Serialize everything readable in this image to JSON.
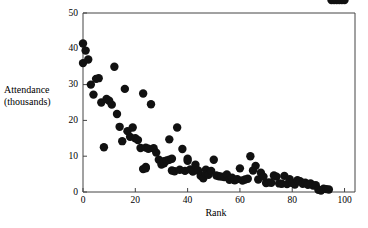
{
  "figure": {
    "background_color": "#ffffff",
    "axis_color": "#444444",
    "marker_color": "#111111",
    "ylabel_line1": "Attendance",
    "ylabel_line2": "(thousands)"
  },
  "chart_data": {
    "type": "scatter",
    "title": "",
    "xlabel": "Rank",
    "ylabel": "Attendance (thousands)",
    "xlim": [
      0,
      104
    ],
    "ylim": [
      0,
      50
    ],
    "xticks": [
      0,
      20,
      40,
      60,
      80,
      100
    ],
    "xtick_labels": [
      "0",
      "20",
      "40",
      "60",
      "80",
      "100"
    ],
    "yticks": [
      0,
      10,
      20,
      30,
      40,
      50
    ],
    "ytick_labels": [
      "0",
      "10",
      "20",
      "30",
      "40",
      "50"
    ],
    "grid": false,
    "legend": null,
    "marker": "circle",
    "marker_size": 4.2,
    "x": [
      0,
      0,
      1,
      2,
      3,
      4,
      5,
      6,
      7,
      8,
      9,
      10,
      11,
      12,
      13,
      14,
      15,
      16,
      17,
      18,
      19,
      20,
      21,
      22,
      23,
      23,
      24,
      24,
      24,
      25,
      26,
      27,
      28,
      29,
      30,
      31,
      31,
      32,
      33,
      33,
      34,
      34,
      35,
      36,
      37,
      38,
      39,
      40,
      40,
      41,
      42,
      43,
      44,
      45,
      46,
      47,
      47,
      48,
      49,
      50,
      51,
      52,
      53,
      54,
      55,
      56,
      57,
      58,
      59,
      60,
      61,
      62,
      63,
      64,
      65,
      66,
      67,
      68,
      69,
      70,
      71,
      72,
      73,
      74,
      75,
      76,
      77,
      78,
      79,
      80,
      81,
      82,
      83,
      84,
      85,
      86,
      87,
      88,
      89,
      90,
      91,
      92,
      93,
      94,
      95,
      96,
      97,
      98,
      99,
      100
    ],
    "y": [
      41.5,
      36.0,
      39.5,
      37.0,
      30.0,
      27.2,
      31.6,
      31.8,
      25.0,
      12.5,
      26.0,
      25.5,
      24.4,
      35.0,
      21.8,
      18.2,
      14.2,
      28.8,
      17.0,
      15.4,
      18.0,
      15.0,
      14.5,
      12.3,
      27.5,
      6.4,
      7.0,
      6.6,
      12.4,
      12.1,
      24.5,
      12.2,
      11.0,
      9.0,
      7.7,
      8.0,
      8.6,
      8.8,
      9.0,
      14.7,
      9.3,
      6.0,
      5.8,
      18.0,
      6.2,
      12.0,
      5.9,
      9.3,
      8.7,
      6.3,
      5.7,
      7.6,
      6.0,
      4.5,
      3.8,
      6.2,
      5.0,
      4.8,
      5.9,
      9.0,
      4.6,
      4.4,
      4.3,
      4.2,
      4.9,
      3.4,
      4.0,
      3.3,
      3.6,
      6.6,
      3.2,
      3.5,
      3.7,
      10.0,
      6.0,
      7.3,
      3.5,
      5.4,
      4.3,
      2.5,
      2.7,
      2.6,
      4.6,
      4.3,
      2.4,
      2.3,
      4.5,
      2.2,
      3.6,
      2.5,
      2.1,
      3.3,
      3.0,
      2.3,
      2.6,
      2.0,
      2.4,
      1.8,
      1.9,
      0.6,
      0.4,
      0.9,
      0.8,
      0.7
    ],
    "n_points": 105
  }
}
